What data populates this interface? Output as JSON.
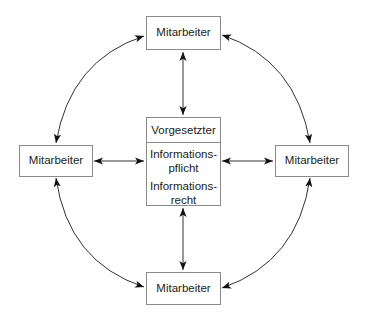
{
  "diagram": {
    "type": "communication-network",
    "nodes": {
      "top": {
        "label": "Mitarbeiter"
      },
      "left": {
        "label": "Mitarbeiter"
      },
      "right": {
        "label": "Mitarbeiter"
      },
      "bottom": {
        "label": "Mitarbeiter"
      },
      "center": {
        "title": "Vorgesetzter",
        "lines": [
          "Informations-",
          "pflicht",
          "Informations-",
          "recht"
        ]
      }
    },
    "edges": [
      {
        "from": "top",
        "to": "center",
        "style": "straight",
        "direction": "bidirectional"
      },
      {
        "from": "left",
        "to": "center",
        "style": "straight",
        "direction": "bidirectional"
      },
      {
        "from": "right",
        "to": "center",
        "style": "straight",
        "direction": "bidirectional"
      },
      {
        "from": "bottom",
        "to": "center",
        "style": "straight",
        "direction": "bidirectional"
      },
      {
        "from": "top",
        "to": "left",
        "style": "arc",
        "direction": "bidirectional"
      },
      {
        "from": "top",
        "to": "right",
        "style": "arc",
        "direction": "bidirectional"
      },
      {
        "from": "bottom",
        "to": "left",
        "style": "arc",
        "direction": "bidirectional"
      },
      {
        "from": "bottom",
        "to": "right",
        "style": "arc",
        "direction": "bidirectional"
      }
    ],
    "colors": {
      "border": "#8a8a8a",
      "line": "#333333",
      "text": "#222222"
    }
  }
}
